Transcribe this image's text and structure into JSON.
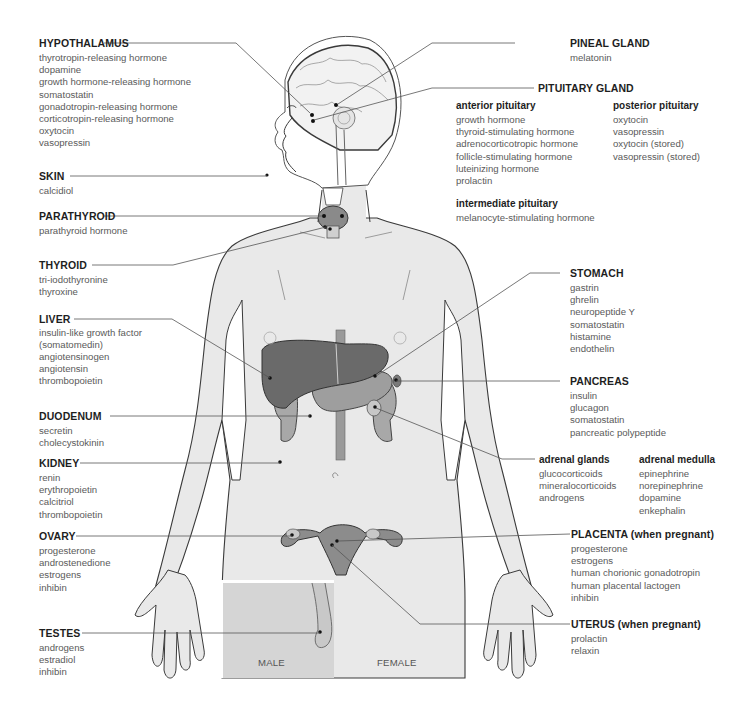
{
  "diagram": {
    "sex_labels": {
      "male": "MALE",
      "female": "FEMALE"
    },
    "colors": {
      "body_fill": "#e9e9e9",
      "outline": "#3a3a3a",
      "organ_dark": "#6e6e6e",
      "organ_mid": "#9a9a9a",
      "organ_light": "#c4c4c4",
      "inset_fill": "#d5d5d5",
      "leader_line": "#555555",
      "title_text": "#1e1e1e",
      "item_text": "#5a5a5a"
    }
  },
  "left_labels": {
    "hypothalamus": {
      "title": "HYPOTHALAMUS",
      "hormones": [
        "thyrotropin-releasing hormone",
        "dopamine",
        "growth hormone-releasing hormone",
        "somatostatin",
        "gonadotropin-releasing hormone",
        "corticotropin-releasing hormone",
        "oxytocin",
        "vasopressin"
      ]
    },
    "skin": {
      "title": "SKIN",
      "hormones": [
        "calcidiol"
      ]
    },
    "parathyroid": {
      "title": "PARATHYROID",
      "hormones": [
        "parathyroid hormone"
      ]
    },
    "thyroid": {
      "title": "THYROID",
      "hormones": [
        "tri-iodothyronine",
        "thyroxine"
      ]
    },
    "liver": {
      "title": "LIVER",
      "hormones": [
        "insulin-like growth factor",
        "(somatomedin)",
        "angiotensinogen",
        "angiotensin",
        "thrombopoietin"
      ]
    },
    "duodenum": {
      "title": "DUODENUM",
      "hormones": [
        "secretin",
        "cholecystokinin"
      ]
    },
    "kidney": {
      "title": "KIDNEY",
      "hormones": [
        "renin",
        "erythropoietin",
        "calcitriol",
        "thrombopoietin"
      ]
    },
    "ovary": {
      "title": "OVARY",
      "hormones": [
        "progesterone",
        "androstenedione",
        "estrogens",
        "inhibin"
      ]
    },
    "testes": {
      "title": "TESTES",
      "hormones": [
        "androgens",
        "estradiol",
        "inhibin"
      ]
    }
  },
  "right_labels": {
    "pineal": {
      "title": "PINEAL GLAND",
      "hormones": [
        "melatonin"
      ]
    },
    "pituitary": {
      "title": "PITUITARY GLAND",
      "anterior": {
        "title": "anterior pituitary",
        "hormones": [
          "growth hormone",
          "thyroid-stimulating hormone",
          "adrenocorticotropic hormone",
          "follicle-stimulating hormone",
          "luteinizing hormone",
          "prolactin"
        ]
      },
      "posterior": {
        "title": "posterior pituitary",
        "hormones": [
          "oxytocin",
          "vasopressin",
          "oxytocin (stored)",
          "vasopressin (stored)"
        ]
      },
      "intermediate": {
        "title": "intermediate pituitary",
        "hormones": [
          "melanocyte-stimulating hormone"
        ]
      }
    },
    "stomach": {
      "title": "STOMACH",
      "hormones": [
        "gastrin",
        "ghrelin",
        "neuropeptide Y",
        "somatostatin",
        "histamine",
        "endothelin"
      ]
    },
    "pancreas": {
      "title": "PANCREAS",
      "hormones": [
        "insulin",
        "glucagon",
        "somatostatin",
        "pancreatic polypeptide"
      ]
    },
    "adrenal_glands": {
      "title": "adrenal glands",
      "hormones": [
        "glucocorticoids",
        "mineralocorticoids",
        "androgens"
      ]
    },
    "adrenal_medulla": {
      "title": "adrenal medulla",
      "hormones": [
        "epinephrine",
        "norepinephrine",
        "dopamine",
        "enkephalin"
      ]
    },
    "placenta": {
      "title": "PLACENTA (when pregnant)",
      "hormones": [
        "progesterone",
        "estrogens",
        "human chorionic gonadotropin",
        "human placental lactogen",
        "inhibin"
      ]
    },
    "uterus": {
      "title": "UTERUS (when pregnant)",
      "hormones": [
        "prolactin",
        "relaxin"
      ]
    }
  }
}
